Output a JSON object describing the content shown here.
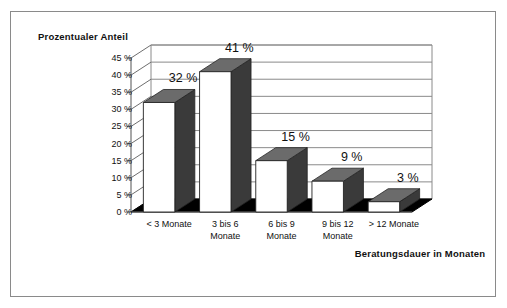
{
  "chart_data": {
    "type": "bar",
    "title": "",
    "subtitle": "",
    "xlabel": "Beratungsdauer\nin Monaten",
    "ylabel": "Prozentualer\nAnteil",
    "categories": [
      "< 3 Monate",
      "3 bis 6\nMonate",
      "6 bis 9\nMonate",
      "9 bis 12\nMonate",
      "> 12 Monate"
    ],
    "values": [
      32,
      41,
      15,
      9,
      3
    ],
    "data_labels": [
      "32 %",
      "41 %",
      "15 %",
      "9 %",
      "3 %"
    ],
    "ylim": [
      0,
      45
    ],
    "ytick_values": [
      0,
      5,
      10,
      15,
      20,
      25,
      30,
      35,
      40,
      45
    ],
    "ytick_labels": [
      "0 %",
      "5 %",
      "10 %",
      "15 %",
      "20 %",
      "25 %",
      "30 %",
      "35 %",
      "40 %",
      "45 %"
    ],
    "grid": true,
    "grid_axis": "y",
    "legend": false,
    "legend_position": "none",
    "style": "3d-column",
    "unit": "%"
  },
  "colors": {
    "bar_front": "#ffffff",
    "bar_top": "#6b6b6b",
    "bar_side": "#3a3a3a",
    "floor": "#000000",
    "gridline": "#8a8a8a",
    "axis": "#6e6e6e",
    "frame_border": "#8a8a8a",
    "text": "#111111",
    "background": "#ffffff"
  }
}
